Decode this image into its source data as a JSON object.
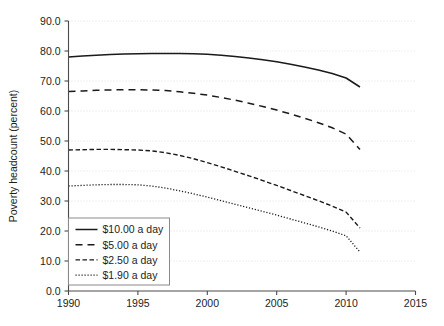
{
  "chart_data": {
    "type": "line",
    "title": "",
    "xlabel": "",
    "ylabel": "Poverty headcount (percent)",
    "xlim": [
      1990,
      2015
    ],
    "ylim": [
      0.0,
      90.0
    ],
    "grid": true,
    "legend_position": "lower-left-inside",
    "x_ticks": [
      "1990",
      "1995",
      "2000",
      "2005",
      "2010",
      "2015"
    ],
    "x_tick_values": [
      1990,
      1995,
      2000,
      2005,
      2010,
      2015
    ],
    "y_ticks": [
      "0.0",
      "10.0",
      "20.0",
      "30.0",
      "40.0",
      "50.0",
      "60.0",
      "70.0",
      "80.0",
      "90.0"
    ],
    "y_tick_values": [
      0.0,
      10.0,
      20.0,
      30.0,
      40.0,
      50.0,
      60.0,
      70.0,
      80.0,
      90.0
    ],
    "x": [
      1990,
      1991,
      1992,
      1993,
      1994,
      1995,
      1996,
      1997,
      1998,
      1999,
      2000,
      2001,
      2002,
      2003,
      2004,
      2005,
      2006,
      2007,
      2008,
      2009,
      2010,
      2011
    ],
    "series": [
      {
        "name": "$10.00 a day",
        "style": "solid",
        "color": "#1a1a1a",
        "values": [
          78.0,
          78.3,
          78.6,
          78.8,
          79.0,
          79.1,
          79.2,
          79.2,
          79.2,
          79.1,
          78.9,
          78.6,
          78.2,
          77.7,
          77.1,
          76.4,
          75.6,
          74.7,
          73.7,
          72.5,
          71.0,
          68.0
        ]
      },
      {
        "name": "$5.00 a day",
        "style": "dashed-long",
        "color": "#1a1a1a",
        "values": [
          66.5,
          66.7,
          66.9,
          67.0,
          67.1,
          67.1,
          67.0,
          66.8,
          66.4,
          65.9,
          65.3,
          64.5,
          63.6,
          62.6,
          61.5,
          60.3,
          59.0,
          57.6,
          56.1,
          54.4,
          52.3,
          47.2
        ]
      },
      {
        "name": "$2.50 a day",
        "style": "dashed-medium",
        "color": "#1a1a1a",
        "values": [
          47.0,
          47.1,
          47.2,
          47.2,
          47.1,
          47.0,
          46.7,
          46.1,
          45.2,
          44.1,
          42.8,
          41.4,
          39.9,
          38.4,
          36.8,
          35.2,
          33.5,
          31.8,
          30.1,
          28.3,
          26.3,
          21.0
        ]
      },
      {
        "name": "$1.90 a day",
        "style": "dotted",
        "color": "#1a1a1a",
        "values": [
          35.0,
          35.2,
          35.4,
          35.5,
          35.5,
          35.4,
          35.0,
          34.3,
          33.4,
          32.4,
          31.3,
          30.1,
          28.9,
          27.7,
          26.5,
          25.3,
          24.0,
          22.7,
          21.4,
          20.0,
          18.4,
          13.0
        ]
      }
    ]
  },
  "legend": {
    "items": [
      {
        "label": "$10.00 a day",
        "style": "solid"
      },
      {
        "label": "$5.00 a day",
        "style": "dashed-long"
      },
      {
        "label": "$2.50 a day",
        "style": "dashed-medium"
      },
      {
        "label": "$1.90 a day",
        "style": "dotted"
      }
    ]
  }
}
